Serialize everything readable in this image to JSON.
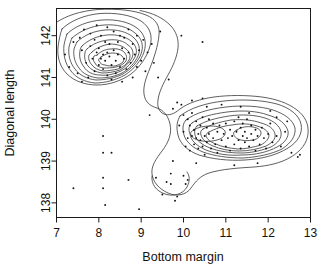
{
  "chart_data": {
    "type": "scatter",
    "title": "",
    "subtitle": "",
    "xlabel": "Bottom margin",
    "ylabel": "Diagonal length",
    "xlim": [
      7,
      13
    ],
    "ylim": [
      137.65,
      142.65
    ],
    "xticks": [
      7,
      8,
      9,
      10,
      11,
      12,
      13
    ],
    "xtick_labels": [
      "7",
      "8",
      "9",
      "10",
      "11",
      "12",
      "13"
    ],
    "yticks": [
      138,
      139,
      140,
      141,
      142
    ],
    "ytick_labels": [
      "138",
      "139",
      "140",
      "141",
      "142"
    ],
    "grid": false,
    "legend": "none",
    "overlay": "2d-kernel-density-contours",
    "contour_levels": 10,
    "modes": [
      {
        "x": 8.2,
        "y": 141.55,
        "label": "genuine-notes-mode"
      },
      {
        "x": 10.4,
        "y": 139.55,
        "label": "counterfeit-mode-left"
      },
      {
        "x": 11.45,
        "y": 139.6,
        "label": "counterfeit-mode-right"
      }
    ],
    "points": [
      [
        7.2,
        141.55
      ],
      [
        7.3,
        141.25
      ],
      [
        7.4,
        141.85
      ],
      [
        7.4,
        138.35
      ],
      [
        7.5,
        141.1
      ],
      [
        7.55,
        141.95
      ],
      [
        7.6,
        140.9
      ],
      [
        7.6,
        141.65
      ],
      [
        7.65,
        142.15
      ],
      [
        7.7,
        141.35
      ],
      [
        7.75,
        141.0
      ],
      [
        7.8,
        141.75
      ],
      [
        7.8,
        142.05
      ],
      [
        7.85,
        141.45
      ],
      [
        7.9,
        141.15
      ],
      [
        7.9,
        141.9
      ],
      [
        7.95,
        141.6
      ],
      [
        7.95,
        142.25
      ],
      [
        8.0,
        141.3
      ],
      [
        8.0,
        141.7
      ],
      [
        8.05,
        141.45
      ],
      [
        8.05,
        142.0
      ],
      [
        8.1,
        141.55
      ],
      [
        8.1,
        141.2
      ],
      [
        8.1,
        139.6
      ],
      [
        8.1,
        139.2
      ],
      [
        8.1,
        138.6
      ],
      [
        8.1,
        138.35
      ],
      [
        8.15,
        141.85
      ],
      [
        8.15,
        141.4
      ],
      [
        8.15,
        137.95
      ],
      [
        8.2,
        141.6
      ],
      [
        8.2,
        141.05
      ],
      [
        8.2,
        142.2
      ],
      [
        8.25,
        141.5
      ],
      [
        8.25,
        141.8
      ],
      [
        8.3,
        141.3
      ],
      [
        8.3,
        140.95
      ],
      [
        8.3,
        139.2
      ],
      [
        8.35,
        141.65
      ],
      [
        8.35,
        142.1
      ],
      [
        8.4,
        141.4
      ],
      [
        8.4,
        141.1
      ],
      [
        8.45,
        141.85
      ],
      [
        8.45,
        141.55
      ],
      [
        8.5,
        141.25
      ],
      [
        8.5,
        142.0
      ],
      [
        8.55,
        141.7
      ],
      [
        8.55,
        140.9
      ],
      [
        8.6,
        141.45
      ],
      [
        8.6,
        141.95
      ],
      [
        8.65,
        141.2
      ],
      [
        8.7,
        141.6
      ],
      [
        8.7,
        142.15
      ],
      [
        8.7,
        138.55
      ],
      [
        8.75,
        141.35
      ],
      [
        8.8,
        141.8
      ],
      [
        8.8,
        141.0
      ],
      [
        8.85,
        141.55
      ],
      [
        8.9,
        141.25
      ],
      [
        8.9,
        142.0
      ],
      [
        8.95,
        141.65
      ],
      [
        8.95,
        137.85
      ],
      [
        9.0,
        141.4
      ],
      [
        9.05,
        141.9
      ],
      [
        9.1,
        141.15
      ],
      [
        9.15,
        141.6
      ],
      [
        9.2,
        140.1
      ],
      [
        9.25,
        141.8
      ],
      [
        9.3,
        141.35
      ],
      [
        9.35,
        138.6
      ],
      [
        9.4,
        141.0
      ],
      [
        9.45,
        142.1
      ],
      [
        9.5,
        138.2
      ],
      [
        9.6,
        138.5
      ],
      [
        9.65,
        140.95
      ],
      [
        9.7,
        138.45
      ],
      [
        9.7,
        138.7
      ],
      [
        9.75,
        140.25
      ],
      [
        9.8,
        138.05
      ],
      [
        9.85,
        140.4
      ],
      [
        9.9,
        139.85
      ],
      [
        9.95,
        140.35
      ],
      [
        10.0,
        140.1
      ],
      [
        10.0,
        139.7
      ],
      [
        10.05,
        139.35
      ],
      [
        10.1,
        140.0
      ],
      [
        10.1,
        139.55
      ],
      [
        10.15,
        139.85
      ],
      [
        10.15,
        139.25
      ],
      [
        10.2,
        139.6
      ],
      [
        10.2,
        140.15
      ],
      [
        10.25,
        139.4
      ],
      [
        10.25,
        139.75
      ],
      [
        10.3,
        139.55
      ],
      [
        10.3,
        139.95
      ],
      [
        10.35,
        139.3
      ],
      [
        10.35,
        139.65
      ],
      [
        10.4,
        139.5
      ],
      [
        10.4,
        139.85
      ],
      [
        10.45,
        139.35
      ],
      [
        10.45,
        140.05
      ],
      [
        10.5,
        139.6
      ],
      [
        10.5,
        139.15
      ],
      [
        10.55,
        139.8
      ],
      [
        10.55,
        139.45
      ],
      [
        10.6,
        139.65
      ],
      [
        10.6,
        140.0
      ],
      [
        10.65,
        139.3
      ],
      [
        10.7,
        139.55
      ],
      [
        10.7,
        139.9
      ],
      [
        10.75,
        139.4
      ],
      [
        10.8,
        139.7
      ],
      [
        10.8,
        139.2
      ],
      [
        10.85,
        139.85
      ],
      [
        10.9,
        139.5
      ],
      [
        10.95,
        139.65
      ],
      [
        11.0,
        139.35
      ],
      [
        11.0,
        139.9
      ],
      [
        11.05,
        139.55
      ],
      [
        11.1,
        139.75
      ],
      [
        11.1,
        139.25
      ],
      [
        11.15,
        139.6
      ],
      [
        11.2,
        139.95
      ],
      [
        11.2,
        139.4
      ],
      [
        11.25,
        139.7
      ],
      [
        11.3,
        139.5
      ],
      [
        11.3,
        140.05
      ],
      [
        11.35,
        139.8
      ],
      [
        11.35,
        139.3
      ],
      [
        11.4,
        139.6
      ],
      [
        11.4,
        139.9
      ],
      [
        11.45,
        139.45
      ],
      [
        11.45,
        139.7
      ],
      [
        11.5,
        139.55
      ],
      [
        11.5,
        140.0
      ],
      [
        11.55,
        139.35
      ],
      [
        11.6,
        139.65
      ],
      [
        11.6,
        139.85
      ],
      [
        11.65,
        139.5
      ],
      [
        11.7,
        139.75
      ],
      [
        11.7,
        139.25
      ],
      [
        11.75,
        139.6
      ],
      [
        11.8,
        139.4
      ],
      [
        11.85,
        139.8
      ],
      [
        11.9,
        139.55
      ],
      [
        11.95,
        139.3
      ],
      [
        12.0,
        139.65
      ],
      [
        12.05,
        139.9
      ],
      [
        12.1,
        139.45
      ],
      [
        12.2,
        139.6
      ],
      [
        12.3,
        139.35
      ],
      [
        12.4,
        139.7
      ],
      [
        12.55,
        139.2
      ],
      [
        12.7,
        139.1
      ],
      [
        9.95,
        142.0
      ],
      [
        10.45,
        141.85
      ],
      [
        10.2,
        140.45
      ],
      [
        10.45,
        140.5
      ],
      [
        9.75,
        139.0
      ],
      [
        10.0,
        138.65
      ],
      [
        9.85,
        138.15
      ],
      [
        10.1,
        138.55
      ],
      [
        10.05,
        138.45
      ],
      [
        10.55,
        140.3
      ],
      [
        11.35,
        140.3
      ],
      [
        12.05,
        140.2
      ],
      [
        12.45,
        139.95
      ],
      [
        12.75,
        139.15
      ],
      [
        11.75,
        138.95
      ],
      [
        11.2,
        138.9
      ],
      [
        10.3,
        138.95
      ],
      [
        12.2,
        140.05
      ],
      [
        10.9,
        140.35
      ],
      [
        11.55,
        140.15
      ]
    ]
  }
}
